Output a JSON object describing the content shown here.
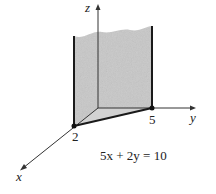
{
  "diagram": {
    "axes": {
      "x_label": "x",
      "y_label": "y",
      "z_label": "z"
    },
    "intercepts": {
      "x_intercept_label": "2",
      "y_intercept_label": "5"
    },
    "equation": "5x + 2y = 10",
    "colors": {
      "plane_fill": "#c8c8c8",
      "axis_stroke": "#333333",
      "edge_stroke": "#1a1a1a"
    }
  }
}
